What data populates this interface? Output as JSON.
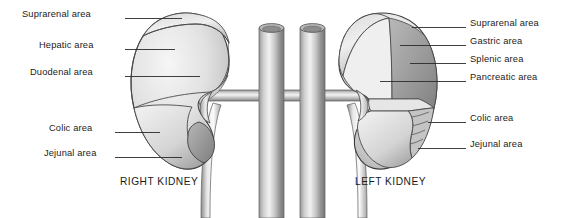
{
  "figure": {
    "background_color": "#ffffff",
    "line_color": "#1b1b1b",
    "organ_fill_light": "#efefef",
    "organ_fill_mid": "#d2d2d2",
    "organ_fill_dark": "#8f8f8f",
    "vessel_fill": "#a9a9a9"
  },
  "left_column": {
    "labels": [
      {
        "id": "suprarenal-area-right",
        "text": "Suprarenal area",
        "text_x": 22,
        "text_y": 9,
        "leader_x1": 125,
        "leader_x2": 182,
        "leader_y": 18.5
      },
      {
        "id": "hepatic-area-right",
        "text": "Hepatic area",
        "text_x": 39,
        "text_y": 40,
        "leader_x1": 125,
        "leader_x2": 175,
        "leader_y": 49.5
      },
      {
        "id": "duodenal-area-right",
        "text": "Duodenal area",
        "text_x": 30,
        "text_y": 67,
        "leader_x1": 125,
        "leader_x2": 200,
        "leader_y": 76.5
      },
      {
        "id": "colic-area-right",
        "text": "Colic area",
        "text_x": 49,
        "text_y": 123,
        "leader_x1": 115,
        "leader_x2": 160,
        "leader_y": 132.5
      },
      {
        "id": "jejunal-area-right",
        "text": "Jejunal area",
        "text_x": 44,
        "text_y": 148,
        "leader_x1": 115,
        "leader_x2": 182,
        "leader_y": 157.5
      }
    ]
  },
  "right_column": {
    "labels": [
      {
        "id": "suprarenal-area-left",
        "text": "Suprarenal area",
        "text_x": 470,
        "text_y": 18,
        "leader_x1": 412,
        "leader_x2": 466,
        "leader_y": 27.5
      },
      {
        "id": "gastric-area-left",
        "text": "Gastric area",
        "text_x": 470,
        "text_y": 36,
        "leader_x1": 400,
        "leader_x2": 466,
        "leader_y": 45.5
      },
      {
        "id": "splenic-area-left",
        "text": "Splenic area",
        "text_x": 470,
        "text_y": 54,
        "leader_x1": 410,
        "leader_x2": 466,
        "leader_y": 63.5
      },
      {
        "id": "pancreatic-area-left",
        "text": "Pancreatic area",
        "text_x": 470,
        "text_y": 72,
        "leader_x1": 380,
        "leader_x2": 466,
        "leader_y": 81.5
      },
      {
        "id": "colic-area-left",
        "text": "Colic area",
        "text_x": 470,
        "text_y": 113,
        "leader_x1": 428,
        "leader_x2": 466,
        "leader_y": 122.5
      },
      {
        "id": "jejunal-area-left",
        "text": "Jejunal area",
        "text_x": 470,
        "text_y": 139,
        "leader_x1": 418,
        "leader_x2": 466,
        "leader_y": 148.5
      }
    ]
  },
  "organ_captions": [
    {
      "id": "right-kidney-caption",
      "text": "RIGHT KIDNEY",
      "x": 120,
      "y": 176
    },
    {
      "id": "left-kidney-caption",
      "text": "LEFT KIDNEY",
      "x": 355,
      "y": 176
    }
  ]
}
